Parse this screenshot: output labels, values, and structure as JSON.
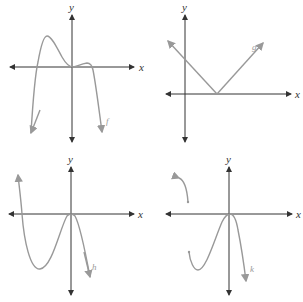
{
  "panels": [
    {
      "id": "f",
      "axis_x_label": "x",
      "axis_y_label": "y",
      "function_label": "f",
      "description": "Quartic-like polynomial, both ends down, local max left, flat touch at origin, small bump right"
    },
    {
      "id": "g",
      "axis_x_label": "x",
      "axis_y_label": "y",
      "function_label": "g",
      "description": "Absolute value V-shape with vertex on positive x-axis"
    },
    {
      "id": "h",
      "axis_x_label": "x",
      "axis_y_label": "y",
      "function_label": "h",
      "description": "Cubic-like curve, up-left end, local min left, touches origin, down-right end"
    },
    {
      "id": "k",
      "axis_x_label": "x",
      "axis_y_label": "y",
      "function_label": "k",
      "description": "Piecewise curve: separate upper-left arc, lower portion with min left, touch at origin, down right"
    }
  ],
  "colors": {
    "axis": "#333333",
    "curve": "#999999",
    "background": "#ffffff"
  }
}
